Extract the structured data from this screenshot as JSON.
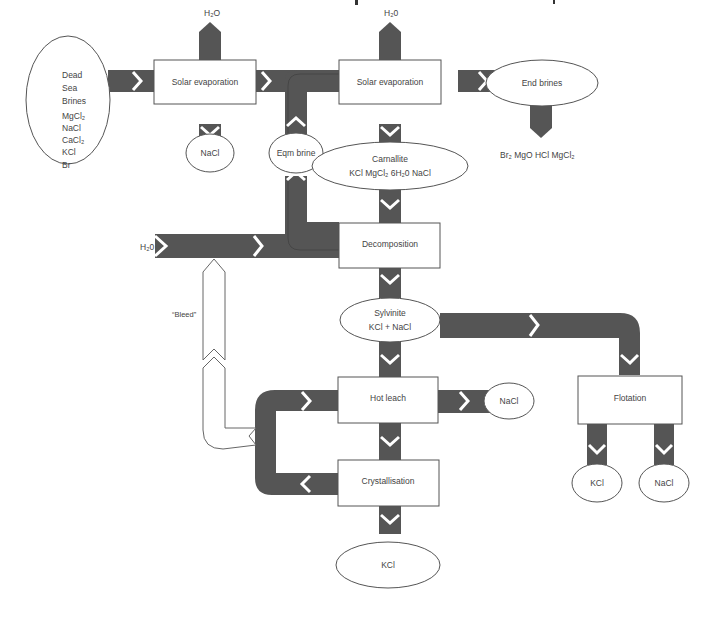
{
  "diagram": {
    "type": "process-flow",
    "title_cropped": true,
    "colors": {
      "pipe": "#555555",
      "node_fill": "#ffffff",
      "outline": "#555555",
      "text": "#444444"
    },
    "nodes": {
      "source": {
        "lines": [
          "Dead",
          "Sea",
          "Brines",
          "MgCl₂",
          "NaCl",
          "CaCl₂",
          "KCl",
          "Br"
        ]
      },
      "solar_evap_1": {
        "label": "Solar evaporation"
      },
      "solar_evap_2": {
        "label": "Solar evaporation"
      },
      "end_brines": {
        "label": "End brines"
      },
      "end_brines_products": {
        "label": "Br₂  MgO  HCl  MgCl₂"
      },
      "nacl_1": {
        "label": "NaCl"
      },
      "eqm_brine": {
        "label": "Eqm brine"
      },
      "carnallite": {
        "title": "Carnallite",
        "formula": "KCl   MgCl₂   6H₂0   NaCl"
      },
      "h2o_top_1": {
        "label": "H₂O"
      },
      "h2o_top_2": {
        "label": "H₂0"
      },
      "h2o_left": {
        "label": "H₂0"
      },
      "decomposition": {
        "label": "Decomposition"
      },
      "bleed": {
        "label": "“Bleed”"
      },
      "sylvinite": {
        "title": "Sylvinite",
        "formula": "KCl + NaCl"
      },
      "hot_leach": {
        "label": "Hot leach"
      },
      "nacl_2": {
        "label": "NaCl"
      },
      "crystallisation": {
        "label": "Crystallisation"
      },
      "kcl_main": {
        "label": "KCl"
      },
      "flotation": {
        "label": "Flotation"
      },
      "kcl_flot": {
        "label": "KCl"
      },
      "nacl_flot": {
        "label": "NaCl"
      }
    },
    "flows": [
      {
        "from": "Dead Sea Brines",
        "to": "Solar evaporation (1)"
      },
      {
        "from": "Solar evaporation (1)",
        "to": "H₂O",
        "direction": "up"
      },
      {
        "from": "Solar evaporation (1)",
        "to": "NaCl",
        "direction": "down"
      },
      {
        "from": "Solar evaporation (1)",
        "to": "Solar evaporation (2)"
      },
      {
        "from": "Solar evaporation (2)",
        "to": "H₂0",
        "direction": "up"
      },
      {
        "from": "Solar evaporation (2)",
        "to": "End brines"
      },
      {
        "from": "End brines",
        "to": "Br₂ MgO HCl MgCl₂",
        "direction": "down"
      },
      {
        "from": "Solar evaporation (2)",
        "to": "Carnallite",
        "direction": "down"
      },
      {
        "from": "Carnallite",
        "to": "Decomposition",
        "direction": "down"
      },
      {
        "from": "H₂0",
        "to": "Decomposition"
      },
      {
        "from": "Decomposition",
        "to": "Eqm brine",
        "direction": "up"
      },
      {
        "from": "Eqm brine",
        "to": "Solar evaporation (2)"
      },
      {
        "from": "Decomposition",
        "to": "Sylvinite",
        "direction": "down"
      },
      {
        "from": "Sylvinite",
        "to": "Hot leach",
        "direction": "down"
      },
      {
        "from": "Sylvinite",
        "to": "Flotation"
      },
      {
        "from": "Hot leach",
        "to": "NaCl"
      },
      {
        "from": "Hot leach",
        "to": "Crystallisation",
        "direction": "down"
      },
      {
        "from": "Crystallisation",
        "to": "Hot leach",
        "note": "recycle loop"
      },
      {
        "from": "Recycle loop",
        "to": "H₂0 line",
        "note": "“Bleed”"
      },
      {
        "from": "Crystallisation",
        "to": "KCl",
        "direction": "down"
      },
      {
        "from": "Flotation",
        "to": "KCl",
        "direction": "down"
      },
      {
        "from": "Flotation",
        "to": "NaCl",
        "direction": "down"
      }
    ]
  }
}
